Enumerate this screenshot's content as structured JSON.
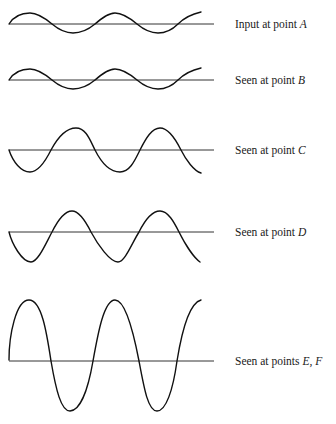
{
  "figure": {
    "colors": {
      "wave": "#111111",
      "baseline": "#333333",
      "text": "#1a1a1a",
      "background": "#ffffff"
    },
    "rows": [
      {
        "id": "A",
        "prefix": "Input at point ",
        "point": "A",
        "baseline_y": 24,
        "amplitude": 10,
        "phase": "sine",
        "label_y": 25
      },
      {
        "id": "B",
        "prefix": "Seen at point ",
        "point": "B",
        "baseline_y": 80,
        "amplitude": 10,
        "phase": "sine",
        "label_y": 81
      },
      {
        "id": "C",
        "prefix": "Seen at point ",
        "point": "C",
        "baseline_y": 150,
        "amplitude": 22,
        "phase": "neg-sine",
        "label_y": 151
      },
      {
        "id": "D",
        "prefix": "Seen at point ",
        "point": "D",
        "baseline_y": 232,
        "amplitude": 28,
        "phase": "neg-sine-triangular",
        "label_y": 233
      },
      {
        "id": "EF",
        "prefix": "Seen at points ",
        "point": "E, F",
        "baseline_y": 361,
        "amplitude": 55,
        "phase": "sine",
        "label_y": 362
      }
    ],
    "wave_x_start": 9,
    "wave_x_end": 201,
    "baseline_x_end": 214,
    "cycles": 2.25
  }
}
